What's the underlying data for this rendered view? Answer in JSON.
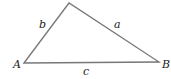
{
  "diagram": {
    "type": "triangle",
    "vertices": [
      {
        "label": "A",
        "x": 24,
        "y": 63
      },
      {
        "label": "B",
        "x": 159,
        "y": 62
      },
      {
        "label": "",
        "x": 69,
        "y": 3
      }
    ],
    "sides": [
      {
        "label": "a",
        "between": "apex-B"
      },
      {
        "label": "b",
        "between": "A-apex"
      },
      {
        "label": "c",
        "between": "A-B"
      }
    ],
    "stroke_color": "#777777"
  },
  "labels": {
    "A": "A",
    "B": "B",
    "a": "a",
    "b": "b",
    "c": "c"
  }
}
